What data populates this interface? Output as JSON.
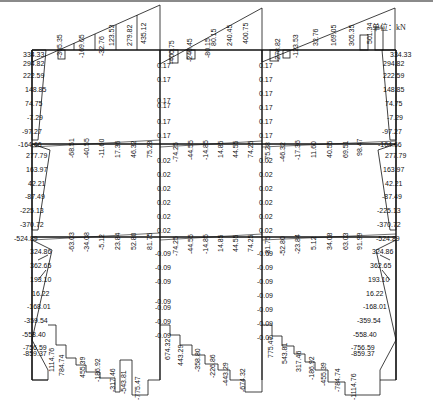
{
  "unit_label": "单位：kN",
  "frame": {
    "columns_x": [
      32,
      160,
      262,
      396
    ],
    "beams_y": [
      50,
      144,
      237
    ],
    "base_y": 380
  },
  "roof_beam_labels": {
    "bay1": [
      "-305.35",
      "-169.05",
      "-32.76",
      "123.53",
      "279.82",
      "435.12"
    ],
    "bay2": [
      "-400.75",
      "-240.45",
      "-80.15",
      "80.15",
      "240.45",
      "400.75"
    ],
    "bay3": [
      "-278.82",
      "-123.53",
      "32.76",
      "169.05",
      "305.35",
      "501.34"
    ],
    "joint_labels": [
      "591.97",
      "592.61",
      "561.35",
      "334.33",
      "294.82"
    ]
  },
  "left_column_labels": {
    "story3": [
      "334.33",
      "294.82",
      "222.59",
      "148.85",
      "74.75",
      "-7.29",
      "-97.27"
    ],
    "story2": [
      "-164.66",
      "277.79",
      "163.97",
      "42.21",
      "-87.49",
      "-225.13",
      "-370.72"
    ],
    "story1": [
      "-524.89",
      "324.86",
      "362.65",
      "193.10",
      "16.22",
      "-168.01",
      "-359.54",
      "-558.40",
      "-756.59",
      "-859.37"
    ]
  },
  "right_column_labels": {
    "story3": [
      "334.33",
      "294.82",
      "222.59",
      "148.85",
      "74.75",
      "-7.29",
      "-97.27"
    ],
    "story2": [
      "-164.66",
      "277.79",
      "163.97",
      "42.21",
      "-87.49",
      "-225.13",
      "-370.72"
    ],
    "story1": [
      "-524.89",
      "324.86",
      "362.65",
      "193.10",
      "16.22",
      "-168.01",
      "-359.54",
      "-558.40",
      "-756.59",
      "-859.37"
    ]
  },
  "interior_column_labels": {
    "story3": [
      "0.17",
      "0.17",
      "0.17",
      "0.17",
      "0.17",
      "0.17"
    ],
    "story2": [
      "0.02",
      "0.02",
      "0.02",
      "0.02",
      "0.02",
      "0.02"
    ],
    "story1": [
      "-0.09",
      "-0.09",
      "-0.09",
      "-0.09",
      "-0.09",
      "-0.09",
      "-0.09"
    ]
  },
  "mid_beam_labels": {
    "bay1": [
      "-68.51",
      "-40.55",
      "-11.60",
      "17.36",
      "46.32",
      "75.28"
    ],
    "bay2": [
      "-74.25",
      "-44.55",
      "-14.85",
      "14.85",
      "44.55",
      "74.25"
    ],
    "bay3": [
      "-75.28",
      "-46.32",
      "-17.36",
      "11.60",
      "40.55",
      "69.51",
      "98.47"
    ]
  },
  "lower_beam_labels": {
    "bay1": [
      "-63.03",
      "-34.08",
      "-5.12",
      "23.84",
      "52.80",
      "81.75"
    ],
    "bay2": [
      "-74.25",
      "-44.55",
      "-14.85",
      "14.85",
      "44.55",
      "74.25"
    ],
    "bay3": [
      "-81.75",
      "-52.80",
      "-23.84",
      "5.12",
      "34.08",
      "63.03",
      "91.99"
    ]
  },
  "foundation_beam_labels": {
    "bay1": [
      "1114.76",
      "784.74",
      "455.39",
      "-186.92",
      "-317.46",
      "-543.81",
      "-775.47"
    ],
    "bay2": [
      "674.32",
      "443.29",
      "-358.80",
      "-226.86",
      "-443.29",
      "-674.32"
    ],
    "bay3": [
      "775.47",
      "543.81",
      "317.46",
      "-186.92",
      "-455.39",
      "-784.74",
      "-1114.76"
    ]
  }
}
